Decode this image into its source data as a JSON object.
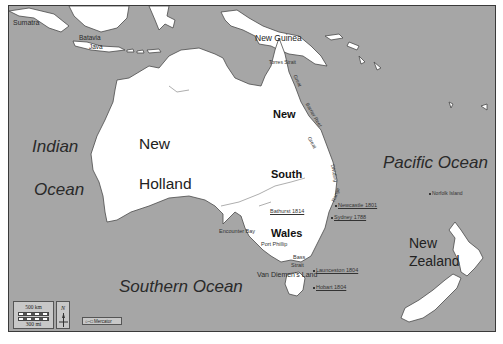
{
  "map": {
    "colors": {
      "sea": "#a6a6a6",
      "land": "#ffffff",
      "coast": "#4a4a4a",
      "frame": "#3a3a3a",
      "text": "#1e1e1e"
    },
    "oceans": [
      {
        "name": "Indian",
        "line2": "Ocean"
      },
      {
        "name": "Pacific Ocean"
      },
      {
        "name": "Southern Ocean"
      }
    ],
    "regions": {
      "new_holland": {
        "line1": "New",
        "line2": "Holland"
      },
      "new_south_wales": {
        "line1": "New",
        "line2": "South",
        "line3": "Wales"
      },
      "new_zealand": {
        "line1": "New",
        "line2": "Zealand"
      },
      "new_guinea": "New Guinea",
      "van_diemens_land": "Van Diemen's Land"
    },
    "places": {
      "sumatra": "Sumatra",
      "batavia": "Batavia",
      "java": "Java",
      "torres_strait": "Torres Strait",
      "great_barrier_reef": {
        "w1": "Great",
        "w2": "Barrier Reef"
      },
      "great_dividing_range": {
        "w1": "Great",
        "w2": "Dividing",
        "w3": "Range"
      },
      "encounter_bay": "Encounter Bay",
      "port_phillip": "Port Phillip",
      "bass_strait": {
        "w1": "Bass",
        "w2": "Strait"
      },
      "norfolk_island": "Norfolk Island"
    },
    "settlements": [
      {
        "name": "Newcastle 1801"
      },
      {
        "name": "Sydney 1788"
      },
      {
        "name": "Bathurst 1814"
      },
      {
        "name": "Launceston 1804"
      },
      {
        "name": "Hobart 1804"
      }
    ],
    "legend": {
      "scale_km": "500 km",
      "scale_mi": "300 mi",
      "north": "N",
      "projection": "Mercator"
    }
  }
}
